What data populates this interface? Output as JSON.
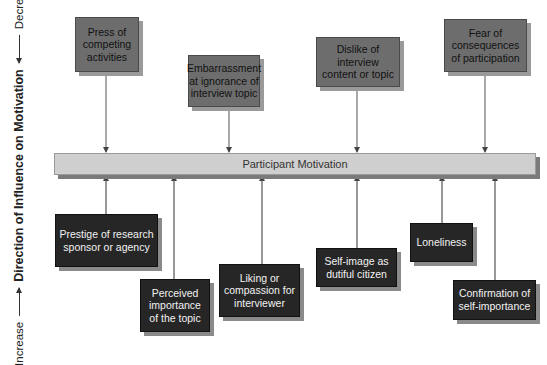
{
  "axis": {
    "title": "Direction of Influence on Motivation",
    "increase_label": "Increase",
    "decrease_label": "Decrease"
  },
  "center": {
    "label": "Participant Motivation"
  },
  "decreasing_factors": [
    {
      "label": "Press of competing activities"
    },
    {
      "label": "Embarrassment at ignorance of interview topic"
    },
    {
      "label": "Dislike of interview content or topic"
    },
    {
      "label": "Fear of consequences of participation"
    }
  ],
  "increasing_factors": [
    {
      "label": "Prestige of research sponsor or agency"
    },
    {
      "label": "Perceived importance of the topic"
    },
    {
      "label": "Liking or compassion for interviewer"
    },
    {
      "label": "Self-image as dutiful citizen"
    },
    {
      "label": "Loneliness"
    },
    {
      "label": "Confirmation of self-importance"
    }
  ],
  "colors": {
    "decrease_box": "#6d6d6d",
    "increase_box": "#262626",
    "center_bar": "#cfcfcf"
  }
}
